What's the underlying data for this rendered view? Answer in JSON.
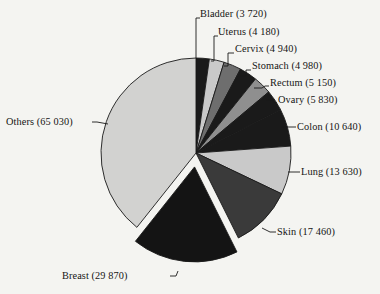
{
  "chart_data": {
    "type": "pie",
    "title": "",
    "subtitle": "",
    "xlabel": "",
    "ylabel": "",
    "legend_position": "callout-labels",
    "grid": false,
    "total": 160390,
    "start_angle_deg": 0,
    "direction": "clockwise",
    "exploded_slices": [
      "Breast"
    ],
    "categories": [
      "Bladder",
      "Uterus",
      "Cervix",
      "Stomach",
      "Rectum",
      "Ovary",
      "Colon",
      "Lung",
      "Skin",
      "Breast",
      "Others"
    ],
    "values": [
      3720,
      4180,
      4940,
      4980,
      5150,
      5830,
      10640,
      13630,
      17460,
      29870,
      65030
    ],
    "labels": [
      "Bladder (3 720)",
      "Uterus (4 180)",
      "Cervix (4 940)",
      "Stomach (4 980)",
      "Rectum (5 150)",
      "Ovary (5 830)",
      "Colon (10 640)",
      "Lung (13 630)",
      "Skin (17 460)",
      "Breast (29 870)",
      "Others (65 030)"
    ],
    "slice_colors": [
      "#1a1a1a",
      "#c9c9c9",
      "#6e6e6e",
      "#1a1a1a",
      "#8f8f8f",
      "#1a1a1a",
      "#1a1a1a",
      "#c9c9c9",
      "#3a3a3a",
      "#141414",
      "#d2d2d0"
    ],
    "outline_color": "#1a1a1a",
    "background_color": "#f4f4f1"
  },
  "slices": [
    {
      "label": "Bladder (3 720)",
      "label_x": 200,
      "label_y": 13,
      "side": "right"
    },
    {
      "label": "Uterus (4 180)",
      "label_x": 218,
      "label_y": 31,
      "side": "right"
    },
    {
      "label": "Cervix (4 940)",
      "label_x": 235,
      "label_y": 48,
      "side": "right"
    },
    {
      "label": "Stomach (4 980)",
      "label_x": 252,
      "label_y": 65,
      "side": "right"
    },
    {
      "label": "Rectum (5 150)",
      "label_x": 269,
      "label_y": 82,
      "side": "right"
    },
    {
      "label": "Ovary (5 830)",
      "label_x": 277,
      "label_y": 99,
      "side": "right"
    },
    {
      "label": "Colon (10 640)",
      "label_x": 296,
      "label_y": 127,
      "side": "right"
    },
    {
      "label": "Lung (13 630)",
      "label_x": 300,
      "label_y": 172,
      "side": "right"
    },
    {
      "label": "Skin (17 460)",
      "label_x": 276,
      "label_y": 232,
      "side": "right"
    },
    {
      "label": "Breast (29 870)",
      "label_x": 102,
      "label_y": 277,
      "side": "left-bottom"
    },
    {
      "label": "Others (65 030)",
      "label_x": 12,
      "label_y": 119,
      "side": "left"
    }
  ]
}
